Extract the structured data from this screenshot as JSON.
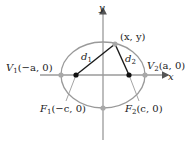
{
  "diagram": {
    "type": "ellipse-foci",
    "colors": {
      "axis": "#9a9a9a",
      "ellipse": "#9a9a9a",
      "segment": "#1a1a1a",
      "focus_dot": "#111111",
      "vertex_dot": "#a8a8a8",
      "text": "#222222"
    },
    "axes": {
      "x_label": "x",
      "y_label": "y"
    },
    "point_label": "(x, y)",
    "distances": {
      "d1": {
        "base": "d",
        "sub": "1"
      },
      "d2": {
        "base": "d",
        "sub": "2"
      }
    },
    "vertices": {
      "v1": {
        "name": "V",
        "sub": "1",
        "coords": "(−a, 0)"
      },
      "v2": {
        "name": "V",
        "sub": "2",
        "coords": "(a, 0)"
      }
    },
    "foci": {
      "f1": {
        "name": "F",
        "sub": "1",
        "coords": "(−c, 0)"
      },
      "f2": {
        "name": "F",
        "sub": "2",
        "coords": "(c, 0)"
      }
    }
  }
}
